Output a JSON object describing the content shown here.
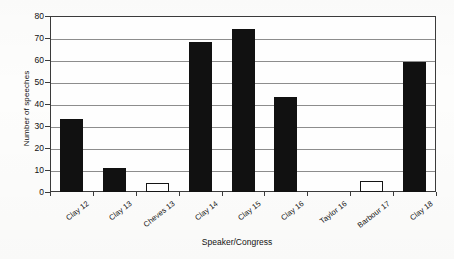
{
  "chart_data": {
    "type": "bar",
    "title": "",
    "xlabel": "Speaker/Congress",
    "ylabel": "Number of speeches",
    "categories": [
      "Clay 12",
      "Clay 13",
      "Cheves 13",
      "Clay 14",
      "Clay 15",
      "Clay 16",
      "Taylor 16",
      "Barbour 17",
      "Clay 18"
    ],
    "values": [
      33,
      11,
      4,
      68,
      74,
      43,
      0,
      5,
      59
    ],
    "bar_styles": [
      "filled",
      "filled",
      "hollow",
      "filled",
      "filled",
      "filled",
      "empty",
      "hollow",
      "filled"
    ],
    "ylim": [
      0,
      80
    ],
    "ytick_labels": [
      "0",
      "10",
      "20",
      "30",
      "40",
      "50",
      "60",
      "70",
      "80"
    ],
    "ytick_values": [
      0,
      10,
      20,
      30,
      40,
      50,
      60,
      70,
      80
    ],
    "grid": true,
    "grid_axis": "y",
    "legend": false,
    "legend_position": "none",
    "colors": {
      "bar_filled": "#111111",
      "bar_hollow_fill": "#ffffff",
      "bar_outline": "#151515",
      "gridline": "#8d8d8d",
      "axis": "#3b3b3b",
      "text": "#121212",
      "plot_background": "#fefefe"
    }
  }
}
